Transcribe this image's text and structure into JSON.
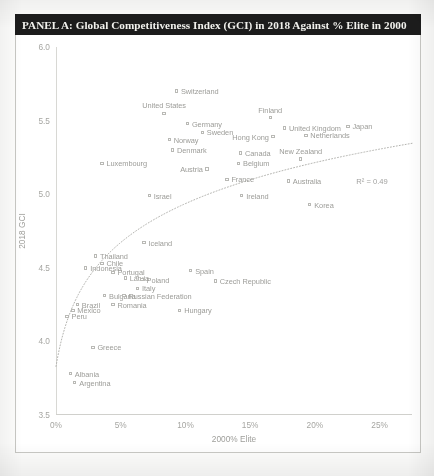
{
  "figure": {
    "title": "PANEL A: Global Competitiveness Index (GCI) in 2018 Against % Elite in 2000",
    "title_bg": "#1c1c1c",
    "title_color": "#f2f2ee"
  },
  "chart_data": {
    "type": "scatter",
    "title": "PANEL A: Global Competitiveness Index (GCI) in 2018 Against % Elite in 2000",
    "xlabel": "2000% Elite",
    "ylabel": "2018 GCI",
    "xlim": [
      0,
      27.5
    ],
    "ylim": [
      3.5,
      6.0
    ],
    "xticks": [
      "0%",
      "5%",
      "10%",
      "15%",
      "20%",
      "25%"
    ],
    "xtick_values": [
      0,
      5,
      10,
      15,
      20,
      25
    ],
    "yticks": [
      "3.5",
      "4.0",
      "4.5",
      "5.0",
      "5.5",
      "6.0"
    ],
    "ytick_values": [
      3.5,
      4.0,
      4.5,
      5.0,
      5.5,
      6.0
    ],
    "grid": false,
    "legend": null,
    "annotations": [
      {
        "text": "R² = 0.49",
        "x": 23.2,
        "y": 5.12
      }
    ],
    "trendline": {
      "type": "logarithmic",
      "r_squared": 0.49,
      "label": "R² = 0.49",
      "style": "dotted",
      "color": "#b4b4b0"
    },
    "points": [
      {
        "label": "Switzerland",
        "x": 9.3,
        "y": 5.7,
        "lx": "right"
      },
      {
        "label": "United States",
        "x": 8.35,
        "y": 5.55,
        "lx": "above"
      },
      {
        "label": "Germany",
        "x": 10.15,
        "y": 5.48,
        "lx": "right"
      },
      {
        "label": "Finland",
        "x": 16.55,
        "y": 5.52,
        "lx": "above"
      },
      {
        "label": "United Kingdom",
        "x": 17.65,
        "y": 5.45,
        "lx": "right"
      },
      {
        "label": "Japan",
        "x": 22.55,
        "y": 5.46,
        "lx": "right"
      },
      {
        "label": "Sweden",
        "x": 11.3,
        "y": 5.42,
        "lx": "right"
      },
      {
        "label": "Hong Kong",
        "x": 16.75,
        "y": 5.39,
        "lx": "left"
      },
      {
        "label": "Netherlands",
        "x": 19.3,
        "y": 5.4,
        "lx": "right"
      },
      {
        "label": "Norway",
        "x": 8.75,
        "y": 5.37,
        "lx": "right"
      },
      {
        "label": "Denmark",
        "x": 9.0,
        "y": 5.3,
        "lx": "right"
      },
      {
        "label": "Canada",
        "x": 14.25,
        "y": 5.28,
        "lx": "right"
      },
      {
        "label": "New Zealand",
        "x": 18.9,
        "y": 5.24,
        "lx": "above"
      },
      {
        "label": "Luxembourg",
        "x": 3.55,
        "y": 5.21,
        "lx": "right"
      },
      {
        "label": "Belgium",
        "x": 14.1,
        "y": 5.21,
        "lx": "right"
      },
      {
        "label": "Austria",
        "x": 11.65,
        "y": 5.17,
        "lx": "left"
      },
      {
        "label": "France",
        "x": 13.2,
        "y": 5.1,
        "lx": "right"
      },
      {
        "label": "Australia",
        "x": 17.95,
        "y": 5.09,
        "lx": "right"
      },
      {
        "label": "Israel",
        "x": 7.2,
        "y": 4.99,
        "lx": "right"
      },
      {
        "label": "Ireland",
        "x": 14.35,
        "y": 4.99,
        "lx": "right"
      },
      {
        "label": "Korea",
        "x": 19.6,
        "y": 4.93,
        "lx": "right"
      },
      {
        "label": "Iceland",
        "x": 6.8,
        "y": 4.67,
        "lx": "right"
      },
      {
        "label": "Thailand",
        "x": 3.05,
        "y": 4.58,
        "lx": "right"
      },
      {
        "label": "Chile",
        "x": 3.55,
        "y": 4.53,
        "lx": "right"
      },
      {
        "label": "Indonesia",
        "x": 2.3,
        "y": 4.5,
        "lx": "right"
      },
      {
        "label": "Portugal",
        "x": 4.4,
        "y": 4.47,
        "lx": "right"
      },
      {
        "label": "Spain",
        "x": 10.4,
        "y": 4.48,
        "lx": "right"
      },
      {
        "label": "Latvia",
        "x": 5.35,
        "y": 4.43,
        "lx": "right"
      },
      {
        "label": "Poland",
        "x": 6.65,
        "y": 4.42,
        "lx": "right"
      },
      {
        "label": "Czech Republic",
        "x": 12.3,
        "y": 4.41,
        "lx": "right"
      },
      {
        "label": "Italy",
        "x": 6.3,
        "y": 4.36,
        "lx": "right"
      },
      {
        "label": "Bulgaria",
        "x": 3.75,
        "y": 4.31,
        "lx": "right"
      },
      {
        "label": "Russian Federation",
        "x": 5.25,
        "y": 4.31,
        "lx": "right"
      },
      {
        "label": "Brazil",
        "x": 1.65,
        "y": 4.25,
        "lx": "right"
      },
      {
        "label": "Romania",
        "x": 4.4,
        "y": 4.25,
        "lx": "right"
      },
      {
        "label": "Mexico",
        "x": 1.3,
        "y": 4.21,
        "lx": "right"
      },
      {
        "label": "Hungary",
        "x": 9.55,
        "y": 4.21,
        "lx": "right"
      },
      {
        "label": "Peru",
        "x": 0.85,
        "y": 4.17,
        "lx": "right"
      },
      {
        "label": "Greece",
        "x": 2.85,
        "y": 3.96,
        "lx": "right"
      },
      {
        "label": "Albania",
        "x": 1.1,
        "y": 3.78,
        "lx": "right"
      },
      {
        "label": "Argentina",
        "x": 1.45,
        "y": 3.72,
        "lx": "right"
      }
    ]
  }
}
